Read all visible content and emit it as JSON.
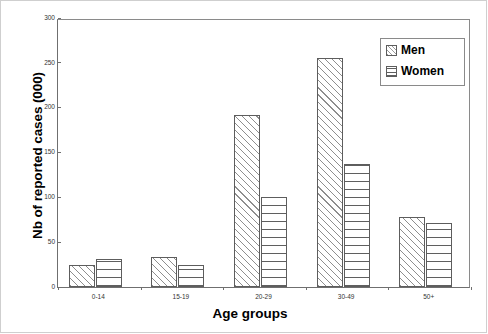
{
  "chart_data": {
    "type": "bar",
    "title": "",
    "xlabel": "Age groups",
    "ylabel": "Nb of reported cases (000)",
    "categories": [
      "0-14",
      "15-19",
      "20-29",
      "30-49",
      "50+"
    ],
    "series": [
      {
        "name": "Men",
        "values": [
          24,
          34,
          192,
          255,
          78
        ]
      },
      {
        "name": "Women",
        "values": [
          31,
          25,
          100,
          137,
          71
        ]
      }
    ],
    "ylim": [
      0,
      300
    ],
    "yticks": [
      0,
      50,
      100,
      150,
      200,
      250,
      300
    ],
    "ytick_labels": [
      "0",
      "50",
      "100",
      "150",
      "200",
      "250",
      "300"
    ],
    "grid": false,
    "legend_position": "top-right",
    "legend_entries": [
      "Men",
      "Women"
    ],
    "patterns": {
      "Men": "diagonal-hatch",
      "Women": "horizontal-lines"
    },
    "colors": {
      "outline": "#5d5d5d",
      "hatch": "#8e8e8e",
      "axis": "#6f6f6f",
      "text": "#000000"
    }
  }
}
